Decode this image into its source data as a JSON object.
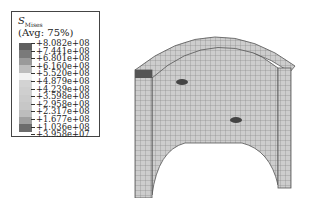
{
  "legend": {
    "variable": "S",
    "subscript": "Mises",
    "averaging": "(Avg: 75%)",
    "values": [
      "+8.082e+08",
      "+7.441e+08",
      "+6.801e+08",
      "+6.160e+08",
      "+5.520e+08",
      "+4.879e+08",
      "+4.239e+08",
      "+3.598e+08",
      "+2.958e+08",
      "+2.317e+08",
      "+1.677e+08",
      "+1.036e+08",
      "+3.958e+07"
    ],
    "colors": [
      "#5f5f5f",
      "#7a7a7a",
      "#9a9a9a",
      "#bdbdbd",
      "#f2f2f2",
      "#d3d3d3",
      "#cfcfcf",
      "#cbcbcb",
      "#c7c7c7",
      "#bdbdbd",
      "#a0a0a0",
      "#6c6c6c"
    ]
  },
  "model": {
    "type": "half-cylinder shell mesh",
    "mesh_color": "#8a8a8a",
    "surface_color": "#cfcfcf"
  }
}
